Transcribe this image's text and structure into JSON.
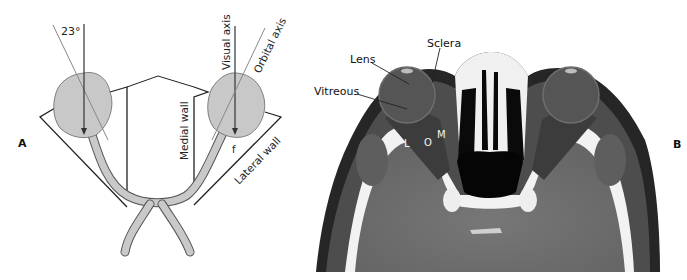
{
  "figure": {
    "panel_a": {
      "letter": "A",
      "labels": {
        "angle": "23°",
        "visual_axis": "Visual axis",
        "orbital_axis": "Orbital axis",
        "medial_wall": "Medial wall",
        "lateral_wall": "Lateral wall",
        "fovea": "f"
      }
    },
    "panel_b": {
      "letter": "B",
      "labels": {
        "sclera": "Sclera",
        "lens": "Lens",
        "vitreous": "Vitreous",
        "lateral_rectus": "L",
        "optic_nerve": "O",
        "medial_rectus": "M"
      }
    },
    "colors": {
      "globe_fill": "#c8c8c8",
      "nerve_fill": "#c9c9c9",
      "line": "#222222",
      "ct_soft_tissue": "#6a6a6a",
      "ct_bone": "#f2f2f2",
      "ct_air": "#050505"
    }
  }
}
